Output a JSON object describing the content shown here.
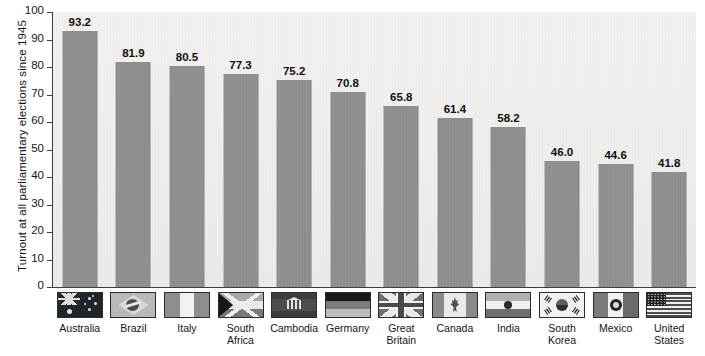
{
  "chart_data": {
    "type": "bar",
    "title": "",
    "xlabel": "",
    "ylabel": "Turnout at all parliamentary elections since 1945",
    "ylim": [
      0,
      100
    ],
    "yticks": [
      0,
      10,
      20,
      30,
      40,
      50,
      60,
      70,
      80,
      90,
      100
    ],
    "grid": false,
    "legend": "none",
    "bar_color": "#8d8d8d",
    "plot_background": "#efeeec",
    "categories": [
      "Australia",
      "Brazil",
      "Italy",
      "South Africa",
      "Cambodia",
      "Germany",
      "Great Britain",
      "Canada",
      "India",
      "South Korea",
      "Mexico",
      "United States"
    ],
    "category_labels": [
      "Australia",
      "Brazil",
      "Italy",
      "South\nAfrica",
      "Cambodia",
      "Germany",
      "Great\nBritain",
      "Canada",
      "India",
      "South\nKorea",
      "Mexico",
      "United\nStates"
    ],
    "values": [
      93.2,
      81.9,
      80.5,
      77.3,
      75.2,
      70.8,
      65.8,
      61.4,
      58.2,
      46.0,
      44.6,
      41.8
    ],
    "value_labels": [
      "93.2",
      "81.9",
      "80.5",
      "77.3",
      "75.2",
      "70.8",
      "65.8",
      "61.4",
      "58.2",
      "46.0",
      "44.6",
      "41.8"
    ],
    "flag_icons": [
      "flag-australia-icon",
      "flag-brazil-icon",
      "flag-italy-icon",
      "flag-south-africa-icon",
      "flag-cambodia-icon",
      "flag-germany-icon",
      "flag-great-britain-icon",
      "flag-canada-icon",
      "flag-india-icon",
      "flag-south-korea-icon",
      "flag-mexico-icon",
      "flag-united-states-icon"
    ]
  }
}
